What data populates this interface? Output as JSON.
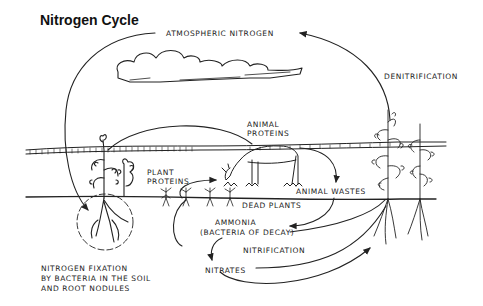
{
  "title": "Nitrogen Cycle",
  "labels": {
    "atmospheric_nitrogen": "ATMOSPHERIC NITROGEN",
    "denitrification": "DENITRIFICATION",
    "animal_proteins_1": "ANIMAL",
    "animal_proteins_2": "PROTEINS",
    "plant_proteins_1": "PLANT",
    "plant_proteins_2": "PROTEINS",
    "animal_wastes": "ANIMAL WASTES",
    "dead_plants": "DEAD PLANTS",
    "ammonia_1": "AMMONIA",
    "ammonia_2": "(BACTERIA OF DECAY)",
    "nitrification": "NITRIFICATION",
    "nitrates": "NITRATES",
    "fixation_1": "NITROGEN FIXATION",
    "fixation_2": "BY BACTERIA IN THE SOIL",
    "fixation_3": "AND ROOT NODULES"
  },
  "colors": {
    "ink": "#222222",
    "background": "#ffffff"
  }
}
